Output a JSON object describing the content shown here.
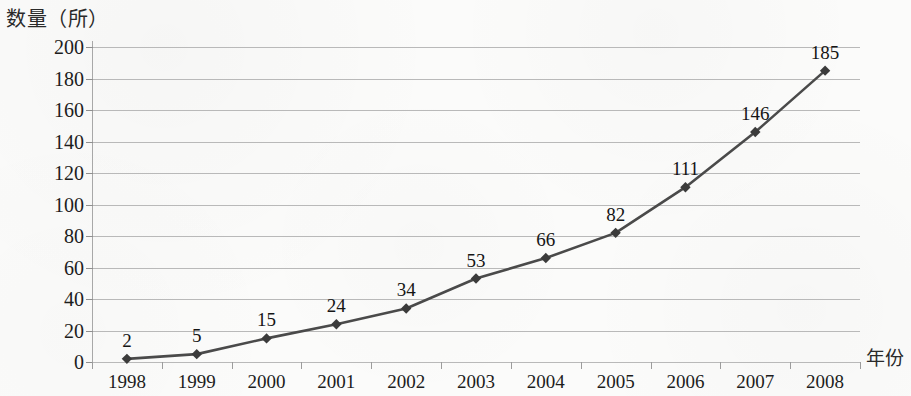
{
  "chart_data": {
    "type": "line",
    "title": "",
    "xlabel": "年份",
    "ylabel": "数量（所）",
    "categories": [
      "1998",
      "1999",
      "2000",
      "2001",
      "2002",
      "2003",
      "2004",
      "2005",
      "2006",
      "2007",
      "2008"
    ],
    "values": [
      2,
      5,
      15,
      24,
      34,
      53,
      66,
      82,
      111,
      146,
      185
    ],
    "point_labels": [
      "2",
      "5",
      "15",
      "24",
      "34",
      "53",
      "66",
      "82",
      "111",
      "146",
      "185"
    ],
    "ylim": [
      0,
      200
    ],
    "ytick_labels": [
      "200",
      "180",
      "160",
      "140",
      "120",
      "100",
      "80",
      "60",
      "40",
      "20",
      "0"
    ],
    "ytick_values": [
      200,
      180,
      160,
      140,
      120,
      100,
      80,
      60,
      40,
      20,
      0
    ],
    "ytick_step": 20,
    "grid": "horizontal",
    "legend": "none",
    "series": [
      {
        "name": "数量（所）",
        "values": [
          2,
          5,
          15,
          24,
          34,
          53,
          66,
          82,
          111,
          146,
          185
        ]
      }
    ],
    "marker": "diamond",
    "colors": {
      "line": "#4a4a4a",
      "marker": "#3b3b3b",
      "grid": "#b9b9b9",
      "axis": "#a8a8a8",
      "text": "#1d1d1d",
      "background": "#fbfbfa"
    }
  }
}
